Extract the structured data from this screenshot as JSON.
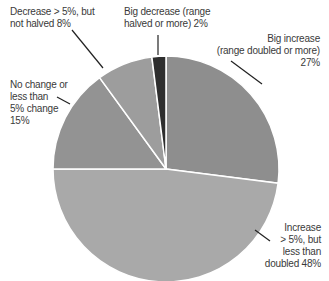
{
  "chart_data": {
    "type": "pie",
    "title": "",
    "start_angle_deg": 0,
    "direction": "clockwise",
    "slices": [
      {
        "label": "Big increase (range doubled or more)",
        "value": 27,
        "color": "#8e8e8e"
      },
      {
        "label": "Increase > 5%, but less than doubled",
        "value": 48,
        "color": "#a9a9a9"
      },
      {
        "label": "No change or less than 5% change",
        "value": 15,
        "color": "#939393"
      },
      {
        "label": "Decrease > 5%, but not halved",
        "value": 8,
        "color": "#9d9d9d"
      },
      {
        "label": "Big decrease (range halved or more)",
        "value": 2,
        "color": "#2e2e2e"
      }
    ]
  },
  "labels": {
    "big_increase": [
      "Big increase",
      "(range doubled or more)",
      "27%"
    ],
    "increase": [
      "Increase",
      "> 5%, but",
      "less than",
      "doubled 48%"
    ],
    "no_change": [
      "No change or",
      "less than",
      "5% change",
      "15%"
    ],
    "decrease": [
      "Decrease > 5%, but",
      "not halved 8%"
    ],
    "big_decrease": [
      "Big decrease (range",
      "halved or more) 2%"
    ]
  }
}
